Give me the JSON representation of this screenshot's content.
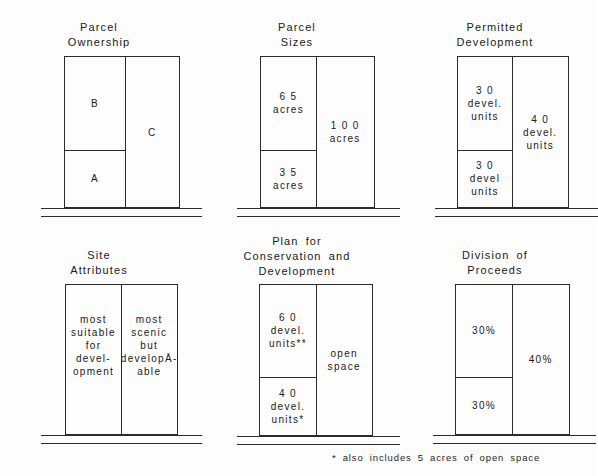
{
  "figure": {
    "footnote": "*  also includes 5 acres of open space"
  },
  "panels": [
    {
      "id": "ownership",
      "title": "Parcel\nOwnership",
      "left_column": {
        "top_cell": {
          "lines": [
            "B"
          ]
        },
        "bottom_cell": {
          "lines": [
            "A"
          ]
        }
      },
      "right_column": {
        "lines": [
          "C"
        ]
      }
    },
    {
      "id": "sizes",
      "title": "Parcel\nSizes",
      "left_column": {
        "top_cell": {
          "lines": [
            "6 5",
            "acres"
          ]
        },
        "bottom_cell": {
          "lines": [
            "3 5",
            "acres"
          ]
        }
      },
      "right_column": {
        "lines": [
          "1 0 0",
          "acres"
        ]
      }
    },
    {
      "id": "permitted",
      "title": "Permitted\nDevelopment",
      "left_column": {
        "top_cell": {
          "lines": [
            "3 0",
            "devel.",
            "units"
          ]
        },
        "bottom_cell": {
          "lines": [
            "3 0",
            "devel",
            "units"
          ]
        }
      },
      "right_column": {
        "lines": [
          "4 0",
          "devel.",
          "units"
        ]
      }
    },
    {
      "id": "attributes",
      "title": "Site\nAttributes",
      "left_column": {
        "top_cell": {
          "lines": [
            "most",
            "suitable",
            "for",
            "devel-",
            "opment"
          ]
        },
        "bottom_cell": {
          "lines": []
        }
      },
      "right_column": {
        "lines": [
          "most",
          "scenic",
          "but",
          "developĀ­-",
          "able"
        ]
      }
    },
    {
      "id": "plan",
      "title": "Plan for\nConservation and\nDevelopment",
      "left_column": {
        "top_cell": {
          "lines": [
            "6 0",
            "devel.",
            "units**"
          ]
        },
        "bottom_cell": {
          "lines": [
            "4 0",
            "devel.",
            "units*"
          ]
        }
      },
      "right_column": {
        "lines": [
          "open",
          "space"
        ]
      }
    },
    {
      "id": "division",
      "title": "Division of\nProceeds",
      "left_column": {
        "top_cell": {
          "lines": [
            "30%"
          ]
        },
        "bottom_cell": {
          "lines": [
            "30%"
          ]
        }
      },
      "right_column": {
        "lines": [
          "40%"
        ]
      }
    }
  ]
}
